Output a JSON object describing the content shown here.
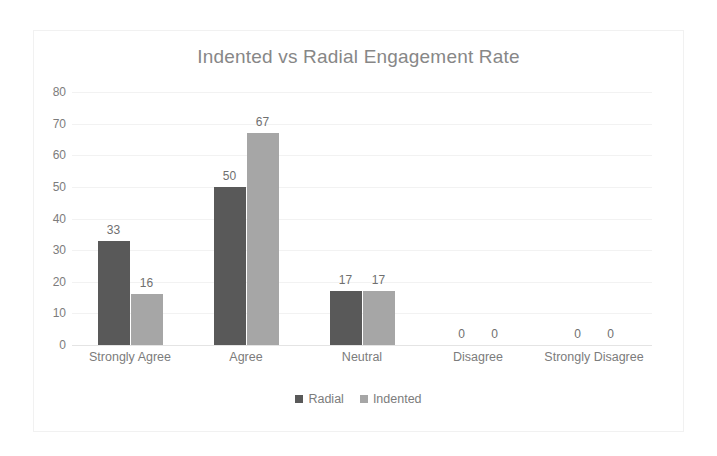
{
  "chart_data": {
    "type": "bar",
    "title": "Indented vs Radial Engagement Rate",
    "xlabel": "",
    "ylabel": "",
    "ylim": [
      0,
      80
    ],
    "yticks": [
      80,
      70,
      60,
      50,
      40,
      30,
      20,
      10,
      0
    ],
    "grid": true,
    "legend_position": "bottom",
    "categories": [
      "Strongly Agree",
      "Agree",
      "Neutral",
      "Disagree",
      "Strongly Disagree"
    ],
    "series": [
      {
        "name": "Radial",
        "color": "#595959",
        "values": [
          33,
          50,
          17,
          0,
          0
        ]
      },
      {
        "name": "Indented",
        "color": "#a6a6a6",
        "values": [
          16,
          67,
          17,
          0,
          0
        ]
      }
    ],
    "data_labels": [
      {
        "category": "Strongly Agree",
        "radial": "33",
        "indented": "16"
      },
      {
        "category": "Agree",
        "radial": "50",
        "indented": "67"
      },
      {
        "category": "Neutral",
        "radial": "17",
        "indented": "17"
      },
      {
        "category": "Disagree",
        "radial": "0",
        "indented": "0"
      },
      {
        "category": "Strongly Disagree",
        "radial": "0",
        "indented": "0"
      }
    ]
  },
  "colors": {
    "title": "#878787",
    "tick_text": "#7c7c7c",
    "gridline": "#f2f2f2",
    "baseline": "#e4e4e4",
    "frame": "#f1f1f1",
    "background": "#ffffff"
  }
}
